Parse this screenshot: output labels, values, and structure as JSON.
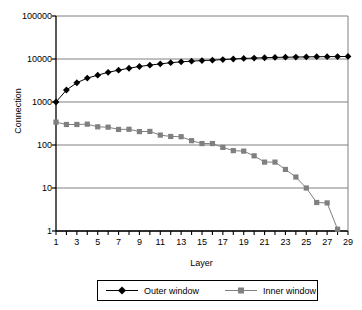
{
  "chart_data": {
    "type": "line",
    "title": "",
    "xlabel": "Layer",
    "ylabel": "Connection",
    "yscale": "log",
    "ylim": [
      1,
      100000
    ],
    "xlim": [
      1,
      29
    ],
    "grid": "horizontal",
    "legend_position": "bottom",
    "y_ticks": [
      "1",
      "10",
      "100",
      "1000",
      "10000",
      "100000"
    ],
    "y_tick_values": [
      1,
      10,
      100,
      1000,
      10000,
      100000
    ],
    "x_ticks": [
      "1",
      "3",
      "5",
      "7",
      "9",
      "11",
      "13",
      "15",
      "17",
      "19",
      "21",
      "23",
      "25",
      "27",
      "29"
    ],
    "x_tick_values": [
      1,
      3,
      5,
      7,
      9,
      11,
      13,
      15,
      17,
      19,
      21,
      23,
      25,
      27,
      29
    ],
    "x": [
      1,
      2,
      3,
      4,
      5,
      6,
      7,
      8,
      9,
      10,
      11,
      12,
      13,
      14,
      15,
      16,
      17,
      18,
      19,
      20,
      21,
      22,
      23,
      24,
      25,
      26,
      27,
      28,
      29
    ],
    "series": [
      {
        "name": "Outer window",
        "color": "#000000",
        "marker": "diamond",
        "values": [
          1000,
          1900,
          2800,
          3600,
          4200,
          4900,
          5500,
          6100,
          6700,
          7200,
          7700,
          8200,
          8600,
          8900,
          9200,
          9400,
          9700,
          10000,
          10300,
          10500,
          10700,
          10900,
          11000,
          11100,
          11200,
          11300,
          11350,
          11400,
          11450
        ]
      },
      {
        "name": "Inner window",
        "color": "#808080",
        "marker": "square",
        "values": [
          340,
          300,
          300,
          305,
          265,
          260,
          230,
          232,
          205,
          207,
          170,
          158,
          156,
          126,
          108,
          108,
          88,
          74,
          72,
          56,
          40,
          40,
          27,
          18,
          10,
          4.6,
          4.5,
          1.1,
          null
        ]
      }
    ]
  },
  "legend": {
    "items": [
      {
        "label": "Outer window"
      },
      {
        "label": "Inner window"
      }
    ]
  },
  "colors": {
    "outer": "#000000",
    "inner": "#808080",
    "grid": "#808080",
    "axis": "#000000",
    "background": "#ffffff"
  }
}
